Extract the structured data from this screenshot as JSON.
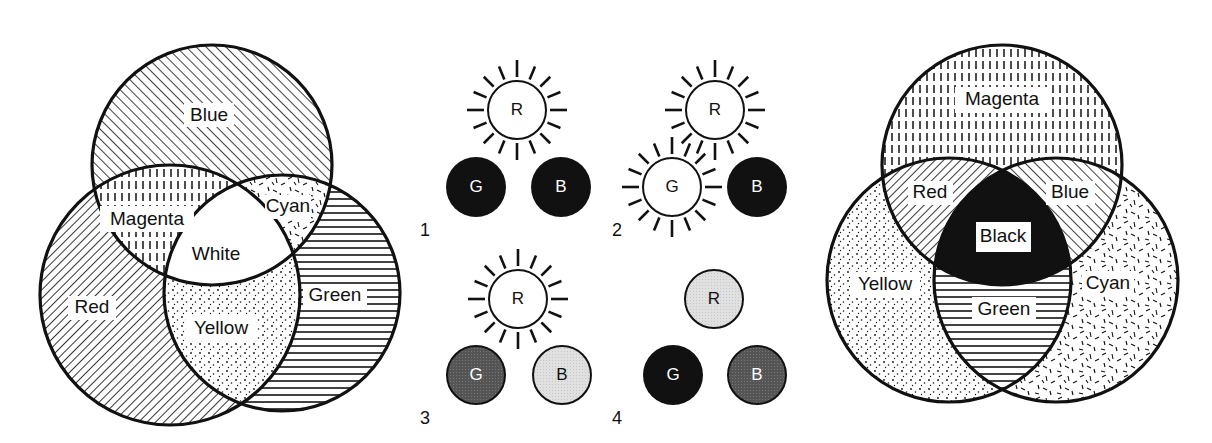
{
  "figure": {
    "panels": [
      {
        "id": "additive",
        "title": "",
        "circles": [
          {
            "name": "Blue",
            "cx": 212,
            "cy": 165,
            "r": 120,
            "pattern": "diag-right"
          },
          {
            "name": "Red",
            "cx": 170,
            "cy": 295,
            "r": 130,
            "pattern": "diag-left"
          },
          {
            "name": "Green",
            "cx": 282,
            "cy": 293,
            "r": 118,
            "pattern": "horizontal"
          }
        ],
        "labels": {
          "blue": "Blue",
          "magenta": "Magenta",
          "cyan": "Cyan",
          "white": "White",
          "red": "Red",
          "green": "Green",
          "yellow": "Yellow"
        }
      },
      {
        "id": "light-sources",
        "numbers": [
          "1",
          "2",
          "3",
          "4"
        ],
        "letters": {
          "r": "R",
          "g": "G",
          "b": "B"
        },
        "groups": [
          {
            "number": "1",
            "R": "lit",
            "G": "black",
            "B": "black"
          },
          {
            "number": "2",
            "R": "lit",
            "G": "lit",
            "B": "black"
          },
          {
            "number": "3",
            "R": "lit",
            "G": "dark-gray",
            "B": "light-gray"
          },
          {
            "number": "4",
            "R": "light-gray",
            "G": "black",
            "B": "dark-gray"
          }
        ]
      },
      {
        "id": "subtractive",
        "circles": [
          {
            "name": "Magenta",
            "cx": 1002,
            "cy": 165,
            "r": 120,
            "pattern": "vertical-dash"
          },
          {
            "name": "Yellow",
            "cx": 949,
            "cy": 280,
            "r": 122,
            "pattern": "dots"
          },
          {
            "name": "Cyan",
            "cx": 1056,
            "cy": 280,
            "r": 122,
            "pattern": "random-dash"
          }
        ],
        "labels": {
          "magenta": "Magenta",
          "red": "Red",
          "blue": "Blue",
          "black": "Black",
          "yellow": "Yellow",
          "green": "Green",
          "cyan": "Cyan"
        }
      }
    ],
    "colors": {
      "ink": "#111111",
      "background": "#ffffff",
      "dark_gray": "#555555",
      "light_gray": "#dddddd"
    }
  }
}
